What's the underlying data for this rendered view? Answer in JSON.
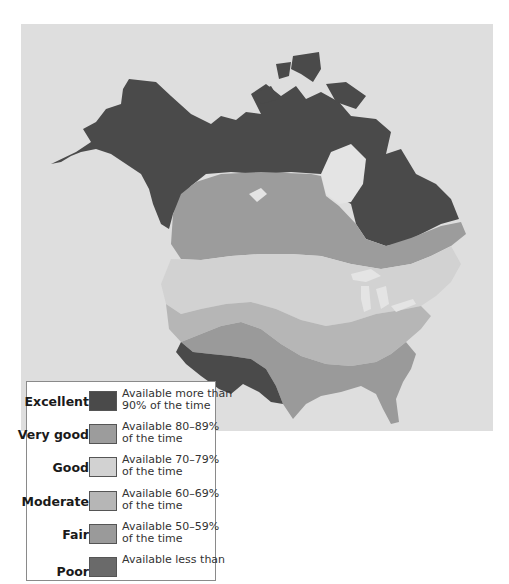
{
  "map": {
    "background_color": "#dedede",
    "water_color": "#e4e4e4",
    "region": "North America (Canada, United States, Alaska)"
  },
  "legend": {
    "items": [
      {
        "label": "Excellent",
        "line1": "Available more than",
        "line2": "90% of the time",
        "color": "#4a4a4a"
      },
      {
        "label": "Very good",
        "line1": "Available 80–89%",
        "line2": "of the time",
        "color": "#9c9c9c"
      },
      {
        "label": "Good",
        "line1": "Available 70–79%",
        "line2": "of the time",
        "color": "#d2d2d2"
      },
      {
        "label": "Moderate",
        "line1": "Available 60–69%",
        "line2": "of the time",
        "color": "#b6b6b6"
      },
      {
        "label": "Fair",
        "line1": "Available 50–59%",
        "line2": "of the time",
        "color": "#9a9a9a"
      },
      {
        "label": "Poor",
        "line1": "Available less than",
        "line2": "",
        "color": "#6a6a6a"
      }
    ]
  }
}
